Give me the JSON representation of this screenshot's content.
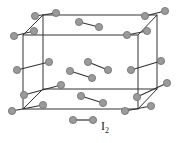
{
  "diagram": {
    "cell": {
      "front": {
        "x1": 23,
        "y1": 35,
        "x2": 138,
        "y2": 109
      },
      "back": {
        "x1": 43,
        "y1": 15,
        "x2": 157,
        "y2": 89
      }
    },
    "molecules": [
      [
        [
          35,
          16
        ],
        [
          56,
          13
        ]
      ],
      [
        [
          14,
          36
        ],
        [
          34,
          31
        ]
      ],
      [
        [
          79,
          22
        ],
        [
          99,
          27
        ]
      ],
      [
        [
          145,
          16
        ],
        [
          165,
          11
        ]
      ],
      [
        [
          127,
          35
        ],
        [
          147,
          31
        ]
      ],
      [
        [
          17,
          70
        ],
        [
          49,
          62
        ]
      ],
      [
        [
          88,
          62
        ],
        [
          108,
          70
        ]
      ],
      [
        [
          70,
          71
        ],
        [
          92,
          78
        ]
      ],
      [
        [
          131,
          70
        ],
        [
          161,
          61
        ]
      ],
      [
        [
          24,
          95
        ],
        [
          61,
          85
        ]
      ],
      [
        [
          12,
          111
        ],
        [
          43,
          105
        ]
      ],
      [
        [
          81,
          96
        ],
        [
          103,
          103
        ]
      ],
      [
        [
          137,
          97
        ],
        [
          167,
          83
        ]
      ],
      [
        [
          125,
          111
        ],
        [
          151,
          106
        ]
      ]
    ],
    "legend": {
      "molecule": [
        [
          73,
          120
        ],
        [
          93,
          120
        ]
      ],
      "label_main": "I",
      "label_sub": "2"
    }
  }
}
